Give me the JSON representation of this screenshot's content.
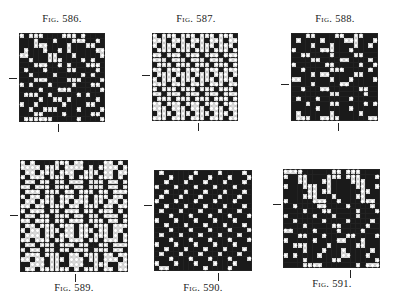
{
  "figures": [
    {
      "id": "586",
      "caption": "Fig. 586.",
      "box": {
        "x": 19,
        "y": 33,
        "w": 86,
        "h": 89
      },
      "caption_pos": {
        "x": 62,
        "y": 13
      },
      "tick_left_y": 78,
      "tick_bottom_x": 58,
      "cols": 18,
      "rows": [
        "eXeeeXXXXeeeXeXXXX",
        "XXXeXXXeXXXeeeXXeX",
        "XXXeeeXXXXeXXXeeXX",
        "XeXXXeXXeXeXXXXXee",
        "eeXXXXeeXXXeXXXXXe",
        "XXeXXXeeeXXXXeXeXX",
        "XXXeeeXXeXeXXXeeeX",
        "XeXXXeXXXXeeXXXXeX",
        "XXeXXXXeXXXXXeXeXX",
        "XXXeeeXXXXeeeXXXXe",
        "eXeXXXeXXXXeXXXeeX",
        "XXXXeXXXeeeXXXXXXe",
        "XeeeXXeXXXXXeXeXXX",
        "XXXXeXXeeXeXXXXXeX",
        "eXXeXXXXXeXXXXeeXX",
        "XXeXXeeeXXXXeXXXXe",
        "XXXeeXXXXeXXXXXeeX",
        "XeeeeeeXXXXXeXXXXe"
      ]
    },
    {
      "id": "587",
      "caption": "Fig. 587.",
      "box": {
        "x": 152,
        "y": 33,
        "w": 86,
        "h": 88
      },
      "caption_pos": {
        "x": 196,
        "y": 13
      },
      "tick_left_y": 75,
      "tick_bottom_x": 198,
      "cols": 18,
      "rows": [
        "eXeeeXeeeXeeeXeeeX",
        "eeeXeeeXeeeXeeeXee",
        "eXeeeXeeeXeeeXeeeX",
        "XeeeXeeeXeeeXeeeXe",
        "eeXeeeXeeeXeeeXeee",
        "eeeXeeeXeeeXeeeXee",
        "XeeeXeeeXeeeXeeeXe",
        "eeXeeeXeeeXeeeXeee",
        "XeeeXeeeXeeeXeeeXe",
        "eXeeeXeeeXeeeXeeeX",
        "eeeXeeeXeeeXeeeXee",
        "eXeeeXeeeXeeeXeeeX",
        "eeXeeeXeeeXeeeXeee",
        "XeeeXeeeXeeeXeeeXe",
        "eeXeeeXeeeXeeeXeee",
        "eeeXeeeXeeeXeeeXee",
        "XeeeXeeeXeeeXeeeXe",
        "eeeXeeeXeeeXeeeXee"
      ]
    },
    {
      "id": "588",
      "caption": "Fig. 588.",
      "box": {
        "x": 291,
        "y": 33,
        "w": 87,
        "h": 88
      },
      "caption_pos": {
        "x": 335,
        "y": 13
      },
      "tick_left_y": 84,
      "tick_bottom_x": 338,
      "cols": 18,
      "rows": [
        "XXXeeXXXXeeXXeeXXX",
        "XeXXXXeXXXXeeeXXXe",
        "XXXXeXXXeXXXXeXXeX",
        "eXXXXXeeeXXXeXXXXX",
        "XXeeXXXXeXXXXeeXXX",
        "XXXXeeXXXXeeXXXXeX",
        "eXXXXXXeeXXXXXeXXe",
        "XXeXXXXXeeeXXXXXeX",
        "XXXXeXeeXXXXXeeXXX",
        "eeXXXXXXeXXXeXXXXe",
        "XXXXeXXXXXeeXXXXXX",
        "XXeXXXeeXXXXXXeeXX",
        "XXXXXXXXeeXXXXXeXX",
        "XeXXXeXXXXXXeXXXXX",
        "XXXeXXXXeeXXXXXeXe",
        "XXXXXeXXXXXXeXXXXX",
        "XeXXXXXXeXXXXXeXXX",
        "XeeeXXeeeeXXXXXXee"
      ]
    },
    {
      "id": "589",
      "caption": "Fig. 589.",
      "box": {
        "x": 20,
        "y": 160,
        "w": 108,
        "h": 112
      },
      "caption_pos": {
        "x": 74,
        "y": 282
      },
      "tick_left_y": 215,
      "tick_bottom_x": 75,
      "cols": 22,
      "rows": [
        "eXeXXXXeeeXeeXXXXeeXeX",
        "eeeeXeeeXeeeeXeXeeeeXe",
        "XeeXeeeXeeeXXeeeXeeXee",
        "eXeeeXeeeXeXeeeXeeeXeX",
        "XeeXeeXeeXeeeXeeeXeeXe",
        "eeXeeeXeeeXeeXeeeXeeXe",
        "XeeeXeeeXeeXeeeXeeXeee",
        "eXeeXeeXeeeXeeXeeeXeeX",
        "XeeXeeeXeeXeeeXeeXeeXe",
        "eeXeeXeeeXeeXeeeXeeXee",
        "eXeeeXeeXeeeXeeXeeeXeX",
        "XeeXeeXeeeXeeXeeXeeeXe",
        "eeXeeeXeeXeeeXeeeXeeXe",
        "XeeXeeeXeeeXeeXeeeXeee",
        "eXeeXeeeXeeXeeeXeeXeeX",
        "XeeeXeeXeeeXeeXeeeXeXe",
        "eeXeeeXeeXeeeXeeXeeeXe",
        "XeeXeeeXeeeXeeXXeeXeee",
        "eXeeXeeXeeXeeeXeeeXeeX",
        "XeeeXeeeXXeeXeeeXeeXee",
        "eeXeeXeeeXeeeXeeXeeeXe",
        "XXeeeXeeXXeeeXXeeeXXee",
        "XeeXeeeeeeXeXeeeXeeXee"
      ]
    },
    {
      "id": "590",
      "caption": "Fig. 590.",
      "box": {
        "x": 154,
        "y": 170,
        "w": 98,
        "h": 101
      },
      "caption_pos": {
        "x": 203,
        "y": 282
      },
      "tick_left_y": 205,
      "tick_bottom_x": 218,
      "cols": 20,
      "rows": [
        "XeXXXXXXeXXXXeXXXXeX",
        "XXXeXXXeXXXeXXXeXXXe",
        "XXeXXXeXXXeXXXeXXXeX",
        "eXXXeXXXeXXXeXXXeXXX",
        "XXeXXXeXXXeXXXeXXXeX",
        "XeXXXeXXXeXXXeXXXeXX",
        "eXXXeXXXeXXXeXXXeXXX",
        "XXeXXXeXXXeXXXeXXXeX",
        "XeXXXeXXXeXXXeXXXeXX",
        "XXXeXXXeXXXeXXXeXXXe",
        "eXXXeXXXeXXXeXXXeXXX",
        "XXeXXXeXXXeXXXeXXXeX",
        "XXXeXXXeXXXeXXXeXXXe",
        "XeXXXeXXXeXXXeXXXeXX",
        "XXXeXXXeXXXeXXXeXXXe",
        "eXXXeXXXeXXXeXXXeXXX",
        "XXeXXXeXXXeXXXeXXXeX",
        "XeXXXeXXXeXXXeXXXeXX",
        "XXXeXXXeXXXeXXXeXXXe",
        "eXXXeXXXeXXXeXXXeXXX",
        "XeeXXXXXXXeXXXXeXXXX"
      ]
    },
    {
      "id": "591",
      "caption": "Fig. 591.",
      "box": {
        "x": 283,
        "y": 169,
        "w": 97,
        "h": 99
      },
      "caption_pos": {
        "x": 332,
        "y": 278
      },
      "tick_left_y": 204,
      "tick_bottom_x": 350,
      "cols": 20,
      "rows": [
        "eeeeXXXXXXeeXeeeXXXX",
        "eXXeeXXXXeeeXeeeXXXe",
        "XXXeeXXXeeXXXXeeeXXX",
        "eXXXeeeXXeXXXXXeeXXe",
        "XXXXXeeXeeXXXXXXeeXX",
        "XXXXeeeXXXeXXXXeeXXX",
        "eXXXXXeeeXXeXXXXeeeX",
        "XXeXXXXeeXXXXeXXXXeX",
        "XXXXeXXXeeXXXXXeXXXe",
        "eXXXXXeXXXeXXXXeXXXX",
        "XXeXXXXXeXXXXeXXXXeX",
        "XXXXeXXXXXeeXXXXXeXX",
        "eeXXXXeXXXXeXXXXeXXX",
        "XXXeeXXXeXXXXeeXXXXe",
        "eXXXXXeXXXXeeXXXeXXX",
        "XXeeeXXXXeXXXXXeeXXX",
        "XXXXeXXXeXXXeXXXXXeX",
        "eXeXXXXeXXXXeeXXXeXX",
        "XXXXeXXXXXeeXXXXXXXe",
        "XXXXeeeeXXXXXXXeXeee"
      ]
    }
  ],
  "legend": {
    "filled": "X",
    "empty": "e"
  },
  "colors": {
    "ink": "#1a1a1a",
    "paper": "#ffffff",
    "grid": "#222222"
  }
}
